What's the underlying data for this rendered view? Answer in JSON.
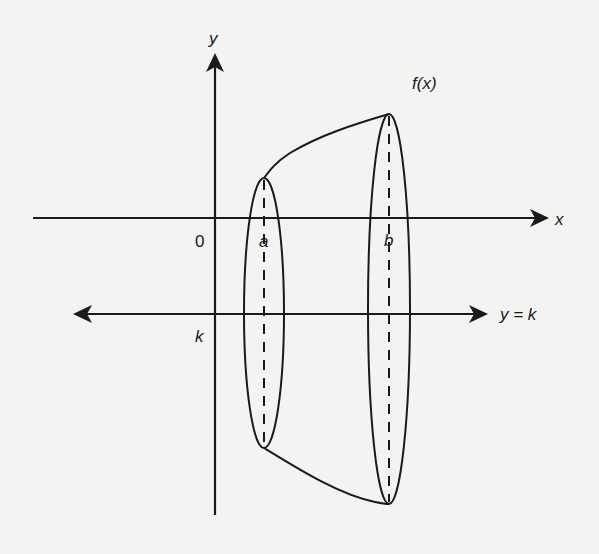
{
  "diagram": {
    "type": "solid-of-revolution",
    "labels": {
      "y_axis": "y",
      "x_axis": "x",
      "origin": "0",
      "a": "a",
      "b": "b",
      "k": "k",
      "function": "f(x)",
      "axis_of_rotation": "y = k"
    },
    "colors": {
      "background": "#f3f3f1",
      "stroke": "#1a1a1a"
    }
  }
}
